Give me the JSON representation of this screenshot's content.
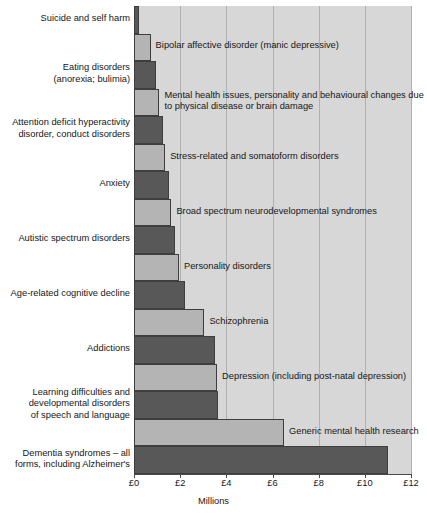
{
  "chart_data": {
    "type": "bar",
    "orientation": "horizontal",
    "title": "",
    "subtitle": "",
    "xlabel": "Millions",
    "ylabel": "",
    "xlim": [
      0,
      12
    ],
    "xticks": [
      0,
      2,
      4,
      6,
      8,
      10,
      12
    ],
    "xtick_labels": [
      "£0",
      "£2",
      "£4",
      "£6",
      "£8",
      "£10",
      "£12"
    ],
    "currency_symbol": "£",
    "grid": "vertical",
    "legend": "none",
    "categories": [
      "Suicide and self harm",
      "Bipolar affective disorder (manic depressive)",
      "Eating disorders (anorexia; bulimia)",
      "Mental health issues, personality and behavioural changes due to physical disease or brain damage",
      "Attention deficit hyperactivity disorder, conduct disorders",
      "Stress-related and somatoform disorders",
      "Anxiety",
      "Broad spectrum neurodevelopmental syndromes",
      "Autistic spectrum disorders",
      "Personality disorders",
      "Age-related cognitive decline",
      "Schizophrenia",
      "Addictions",
      "Depression (including post-natal depression)",
      "Learning difficulties and developmental disorders of speech and language",
      "Generic mental health research",
      "Dementia syndromes – all forms, including Alzheimer's"
    ],
    "values": [
      0.22,
      0.72,
      0.95,
      1.1,
      1.25,
      1.35,
      1.5,
      1.62,
      1.78,
      1.95,
      2.2,
      3.05,
      3.5,
      3.6,
      3.65,
      6.5,
      11.0
    ],
    "bar_shades": [
      "dark",
      "light",
      "dark",
      "light",
      "dark",
      "light",
      "dark",
      "light",
      "dark",
      "light",
      "dark",
      "light",
      "dark",
      "light",
      "dark",
      "light",
      "dark"
    ],
    "colors": {
      "dark_bar": "#585858",
      "light_bar": "#b4b4b4",
      "plot_background": "#d7d7d7",
      "gridline": "#b0b0b0",
      "axis": "#4a4a4a",
      "text": "#161616",
      "page_background": "#ffffff"
    }
  },
  "bars": [
    {
      "label": "Suicide and self harm",
      "value": 0.22,
      "shade": "dark",
      "label_position": "left",
      "label_text": "Suicide and self harm"
    },
    {
      "label": "Bipolar affective disorder (manic depressive)",
      "value": 0.72,
      "shade": "light",
      "label_position": "inline",
      "label_text": "Bipolar affective disorder (manic depressive)"
    },
    {
      "label": "Eating disorders (anorexia; bulimia)",
      "value": 0.95,
      "shade": "dark",
      "label_position": "left",
      "label_text": "Eating disorders\n(anorexia; bulimia)"
    },
    {
      "label": "Mental health issues, personality and behavioural changes due to physical disease or brain damage",
      "value": 1.1,
      "shade": "light",
      "label_position": "inline",
      "label_text": "Mental health issues, personality and behavioural changes due\nto physical disease or brain damage"
    },
    {
      "label": "Attention deficit hyperactivity disorder, conduct disorders",
      "value": 1.25,
      "shade": "dark",
      "label_position": "left",
      "label_text": "Attention deficit hyperactivity\ndisorder, conduct disorders"
    },
    {
      "label": "Stress-related and somatoform disorders",
      "value": 1.35,
      "shade": "light",
      "label_position": "inline",
      "label_text": "Stress-related and somatoform disorders"
    },
    {
      "label": "Anxiety",
      "value": 1.5,
      "shade": "dark",
      "label_position": "left",
      "label_text": "Anxiety"
    },
    {
      "label": "Broad spectrum neurodevelopmental syndromes",
      "value": 1.62,
      "shade": "light",
      "label_position": "inline",
      "label_text": "Broad spectrum neurodevelopmental syndromes"
    },
    {
      "label": "Autistic spectrum disorders",
      "value": 1.78,
      "shade": "dark",
      "label_position": "left",
      "label_text": "Autistic spectrum disorders"
    },
    {
      "label": "Personality disorders",
      "value": 1.95,
      "shade": "light",
      "label_position": "inline",
      "label_text": "Personality disorders"
    },
    {
      "label": "Age-related cognitive decline",
      "value": 2.2,
      "shade": "dark",
      "label_position": "left",
      "label_text": "Age-related cognitive decline"
    },
    {
      "label": "Schizophrenia",
      "value": 3.05,
      "shade": "light",
      "label_position": "inline",
      "label_text": "Schizophrenia"
    },
    {
      "label": "Addictions",
      "value": 3.5,
      "shade": "dark",
      "label_position": "left",
      "label_text": "Addictions"
    },
    {
      "label": "Depression (including post-natal depression)",
      "value": 3.6,
      "shade": "light",
      "label_position": "inline",
      "label_text": "Depression (including post-natal depression)"
    },
    {
      "label": "Learning difficulties and developmental disorders of speech and language",
      "value": 3.65,
      "shade": "dark",
      "label_position": "left",
      "label_text": "Learning difficulties and\ndevelopmental disorders\nof speech and language"
    },
    {
      "label": "Generic mental health research",
      "value": 6.5,
      "shade": "light",
      "label_position": "inline",
      "label_text": "Generic mental health research"
    },
    {
      "label": "Dementia syndromes – all forms, including Alzheimer's",
      "value": 11.0,
      "shade": "dark",
      "label_position": "left",
      "label_text": "Dementia syndromes – all\nforms, including Alzheimer's"
    }
  ],
  "axis": {
    "title": "Millions",
    "ticks": [
      {
        "value": 0,
        "label": "£0"
      },
      {
        "value": 2,
        "label": "£2"
      },
      {
        "value": 4,
        "label": "£4"
      },
      {
        "value": 6,
        "label": "£6"
      },
      {
        "value": 8,
        "label": "£8"
      },
      {
        "value": 10,
        "label": "£10"
      },
      {
        "value": 12,
        "label": "£12"
      }
    ]
  }
}
